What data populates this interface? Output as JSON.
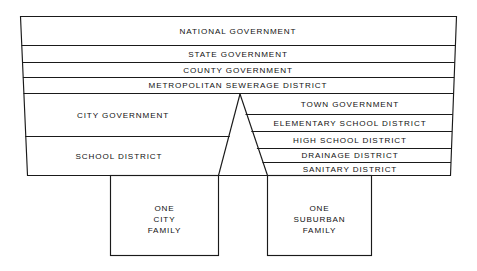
{
  "diagram": {
    "colors": {
      "background": "#ffffff",
      "stroke": "#1a1a1a",
      "text": "#111111"
    },
    "shared_bands": [
      {
        "label": "NATIONAL GOVERNMENT"
      },
      {
        "label": "STATE GOVERNMENT"
      },
      {
        "label": "COUNTY GOVERNMENT"
      },
      {
        "label": "METROPOLITAN SEWERAGE DISTRICT"
      }
    ],
    "left_bands": [
      {
        "label": "CITY GOVERNMENT"
      },
      {
        "label": "SCHOOL DISTRICT"
      }
    ],
    "right_bands": [
      {
        "label": "TOWN GOVERNMENT"
      },
      {
        "label": "ELEMENTARY SCHOOL DISTRICT"
      },
      {
        "label": "HIGH SCHOOL DISTRICT"
      },
      {
        "label": "DRAINAGE DISTRICT"
      },
      {
        "label": "SANITARY DISTRICT"
      }
    ],
    "left_box": {
      "line1": "ONE",
      "line2": "CITY",
      "line3": "FAMILY"
    },
    "right_box": {
      "line1": "ONE",
      "line2": "SUBURBAN",
      "line3": "FAMILY"
    }
  }
}
